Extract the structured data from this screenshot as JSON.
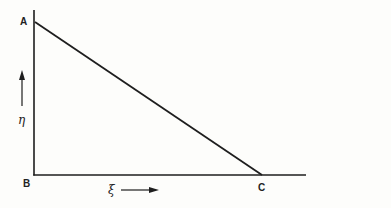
{
  "diagram": {
    "type": "right-triangle-coordinate-sketch",
    "vertices": [
      {
        "id": "A",
        "label": "A",
        "x": 34,
        "y": 22
      },
      {
        "id": "B",
        "label": "B",
        "x": 34,
        "y": 175
      },
      {
        "id": "C",
        "label": "C",
        "x": 262,
        "y": 175
      }
    ],
    "axes": {
      "vertical": {
        "symbol": "η",
        "direction": "up"
      },
      "horizontal": {
        "symbol": "ξ",
        "direction": "right"
      }
    },
    "colors": {
      "line": "#1e1e1e",
      "background": "#fdfdfb"
    }
  },
  "labels": {
    "a": "A",
    "b": "B",
    "c": "C",
    "eta": "η",
    "xi": "ξ"
  }
}
